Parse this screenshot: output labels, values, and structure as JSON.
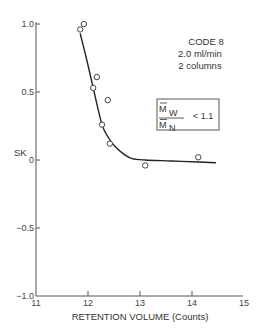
{
  "chart_data": {
    "type": "scatter",
    "title": "",
    "xlabel": "RETENTION VOLUME (Counts)",
    "ylabel": "SK",
    "xlim": [
      11,
      15
    ],
    "ylim": [
      -1.0,
      1.0
    ],
    "grid": false,
    "x_ticks": [
      11,
      12,
      13,
      14,
      15
    ],
    "x_tick_labels": [
      "11",
      "12",
      "13",
      "14",
      "15"
    ],
    "y_ticks": [
      1.0,
      0.5,
      0,
      -0.5,
      -1.0
    ],
    "y_tick_labels": [
      "1.0",
      "0.5",
      "0",
      "−0.5",
      "−1.0"
    ],
    "series": [
      {
        "name": "measured",
        "marker": "open-circle",
        "points": [
          {
            "x": 11.92,
            "y": 1.0
          },
          {
            "x": 11.85,
            "y": 0.96
          },
          {
            "x": 12.17,
            "y": 0.61
          },
          {
            "x": 12.1,
            "y": 0.53
          },
          {
            "x": 12.38,
            "y": 0.44
          },
          {
            "x": 12.27,
            "y": 0.26
          },
          {
            "x": 12.42,
            "y": 0.12
          },
          {
            "x": 13.1,
            "y": -0.04
          },
          {
            "x": 14.12,
            "y": 0.02
          }
        ]
      },
      {
        "name": "fitted curve",
        "marker": "line",
        "points": [
          {
            "x": 11.85,
            "y": 0.93
          },
          {
            "x": 11.98,
            "y": 0.73
          },
          {
            "x": 12.1,
            "y": 0.53
          },
          {
            "x": 12.27,
            "y": 0.26
          },
          {
            "x": 12.4,
            "y": 0.16
          },
          {
            "x": 12.52,
            "y": 0.1
          },
          {
            "x": 12.7,
            "y": 0.04
          },
          {
            "x": 12.85,
            "y": 0.01
          },
          {
            "x": 13.1,
            "y": 0.0
          },
          {
            "x": 13.6,
            "y": -0.007
          },
          {
            "x": 14.12,
            "y": -0.015
          },
          {
            "x": 14.46,
            "y": -0.02
          }
        ]
      }
    ],
    "annotations": {
      "code": "CODE 8",
      "flow": "2.0 ml/min",
      "columns": "2 columns",
      "ratio_numerator": "M",
      "ratio_numerator_sub": "W",
      "ratio_denominator": "M",
      "ratio_denominator_sub": "N",
      "ratio_condition": "< 1.1"
    }
  }
}
